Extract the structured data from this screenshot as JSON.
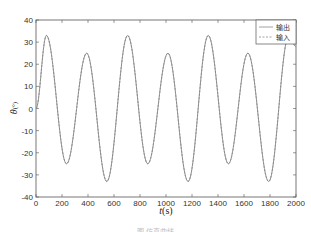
{
  "chart_data": {
    "type": "line",
    "title": "",
    "xlabel": "t(s)",
    "ylabel": "θ(°)",
    "xlim": [
      0,
      2000
    ],
    "ylim": [
      -40,
      40
    ],
    "xticks": [
      0,
      200,
      400,
      600,
      800,
      1000,
      1200,
      1400,
      1600,
      1800,
      2000
    ],
    "yticks": [
      -40,
      -30,
      -20,
      -10,
      0,
      10,
      20,
      30,
      40
    ],
    "grid": false,
    "legend_position": "upper right",
    "legend": [
      "输出",
      "输入"
    ],
    "series": [
      {
        "name": "输出",
        "style": "solid",
        "extrema": [
          {
            "x": 0,
            "y": 0
          },
          {
            "x": 80,
            "y": 33
          },
          {
            "x": 235,
            "y": -25
          },
          {
            "x": 390,
            "y": 25
          },
          {
            "x": 545,
            "y": -33
          },
          {
            "x": 705,
            "y": 33
          },
          {
            "x": 860,
            "y": -25
          },
          {
            "x": 1015,
            "y": 25
          },
          {
            "x": 1170,
            "y": -33
          },
          {
            "x": 1325,
            "y": 33
          },
          {
            "x": 1480,
            "y": -25
          },
          {
            "x": 1630,
            "y": 25
          },
          {
            "x": 1790,
            "y": -33
          },
          {
            "x": 1945,
            "y": 33
          },
          {
            "x": 2000,
            "y": 28
          }
        ]
      },
      {
        "name": "输入",
        "style": "dashed",
        "extrema": [
          {
            "x": 0,
            "y": 0
          },
          {
            "x": 80,
            "y": 33
          },
          {
            "x": 235,
            "y": -25
          },
          {
            "x": 390,
            "y": 25
          },
          {
            "x": 545,
            "y": -33
          },
          {
            "x": 705,
            "y": 33
          },
          {
            "x": 860,
            "y": -25
          },
          {
            "x": 1015,
            "y": 25
          },
          {
            "x": 1170,
            "y": -33
          },
          {
            "x": 1325,
            "y": 33
          },
          {
            "x": 1480,
            "y": -25
          },
          {
            "x": 1630,
            "y": 25
          },
          {
            "x": 1790,
            "y": -33
          },
          {
            "x": 1945,
            "y": 33
          },
          {
            "x": 2000,
            "y": 28
          }
        ]
      }
    ]
  },
  "legend": {
    "items": [
      {
        "label": "输出",
        "style": "solid"
      },
      {
        "label": "输入",
        "style": "dashed"
      }
    ]
  },
  "axes": {
    "xlabel_var": "t",
    "xlabel_unit": "(s)",
    "ylabel_var": "θ",
    "ylabel_unit": "(°)"
  },
  "colors": {
    "line": "#8a8a8a",
    "axis": "#555555"
  },
  "caption": "图 仿真曲线"
}
